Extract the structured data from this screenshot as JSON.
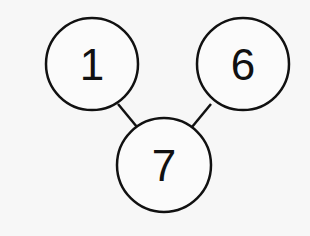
{
  "diagram": {
    "type": "tree",
    "nodes": [
      {
        "id": "n1",
        "label": "1",
        "cx": 92,
        "cy": 64,
        "r": 46
      },
      {
        "id": "n6",
        "label": "6",
        "cx": 243,
        "cy": 64,
        "r": 46
      },
      {
        "id": "n7",
        "label": "7",
        "cx": 164,
        "cy": 165,
        "r": 47
      }
    ],
    "edges": [
      {
        "from": "n1",
        "to": "n7"
      },
      {
        "from": "n6",
        "to": "n7"
      }
    ],
    "colors": {
      "stroke": "#111111",
      "fill": "#fbfbfb",
      "background": "#f7f7f7"
    }
  }
}
